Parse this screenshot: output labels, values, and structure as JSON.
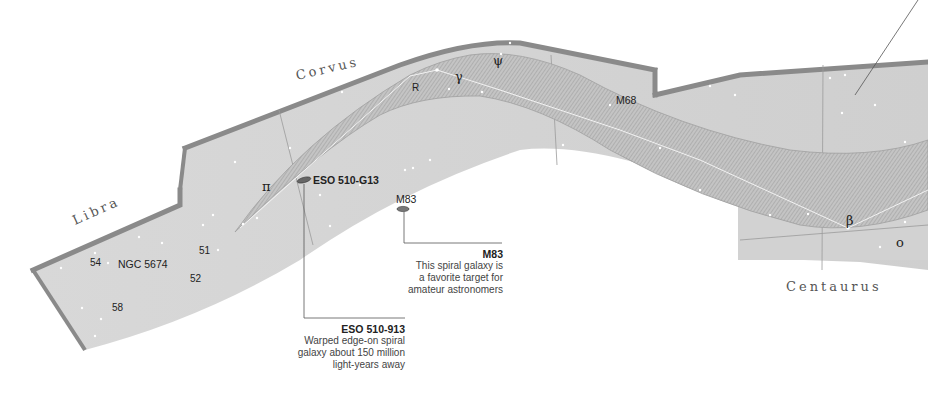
{
  "constellations": {
    "libra": "Libra",
    "corvus": "Corvus",
    "centaurus": "Centaurus"
  },
  "star_labels": {
    "s54": "54",
    "s51": "51",
    "s52": "52",
    "s58": "58",
    "ngc5674": "NGC 5674"
  },
  "greek_labels": {
    "pi": "π",
    "r": "R",
    "gamma": "γ",
    "psi": "ψ",
    "beta": "β",
    "omicron": "o"
  },
  "objects": {
    "eso": "ESO 510-G13",
    "m83": "M83",
    "m68": "M68"
  },
  "callouts": {
    "m83": {
      "title": "M83",
      "lines": [
        "This spiral galaxy is",
        "a favorite target for",
        "amateur astronomers"
      ]
    },
    "eso": {
      "title": "ESO 510-913",
      "lines": [
        "Warped edge-on spiral",
        "galaxy about 150 million",
        "light-years away"
      ]
    }
  },
  "colors": {
    "panel_fill": "#d6d6d6",
    "panel_edge": "#8a8a8a",
    "hydra_band": "#bdbdbd",
    "leader_line": "#555555"
  }
}
